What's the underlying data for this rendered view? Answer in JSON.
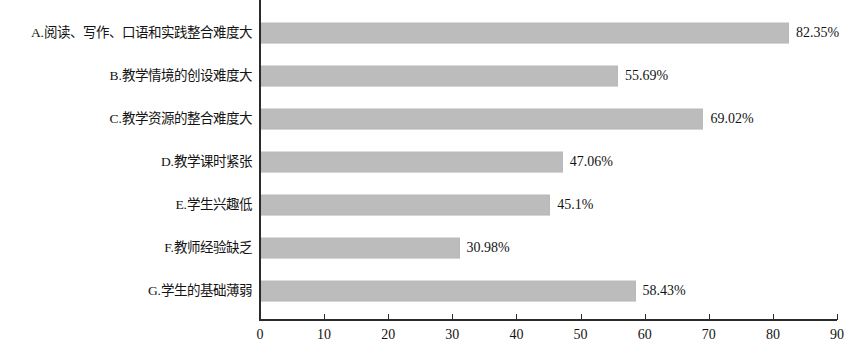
{
  "chart_data": {
    "type": "bar",
    "orientation": "horizontal",
    "title": "",
    "subtitle": "",
    "xlabel": "",
    "ylabel": "",
    "categories": [
      "A.阅读、写作、口语和实践整合难度大",
      "B.教学情境的创设难度大",
      "C.教学资源的整合难度大",
      "D.教学课时紧张",
      "E.学生兴趣低",
      "F.教师经验缺乏",
      "G.学生的基础薄弱"
    ],
    "values": [
      82.35,
      55.69,
      69.02,
      47.06,
      45.1,
      30.98,
      58.43
    ],
    "value_labels": [
      "82.35%",
      "55.69%",
      "69.02%",
      "47.06%",
      "45.1%",
      "30.98%",
      "58.43%"
    ],
    "xlim": [
      0,
      90
    ],
    "xticks": [
      0,
      10,
      20,
      30,
      40,
      50,
      60,
      70,
      80,
      90
    ],
    "xtick_labels": [
      "0",
      "10",
      "20",
      "30",
      "40",
      "50",
      "60",
      "70",
      "80",
      "90"
    ],
    "grid": false,
    "legend": null,
    "bar_color": "#bcbcbc",
    "axis_color": "#2b2b2b",
    "text_color": "#141414"
  }
}
